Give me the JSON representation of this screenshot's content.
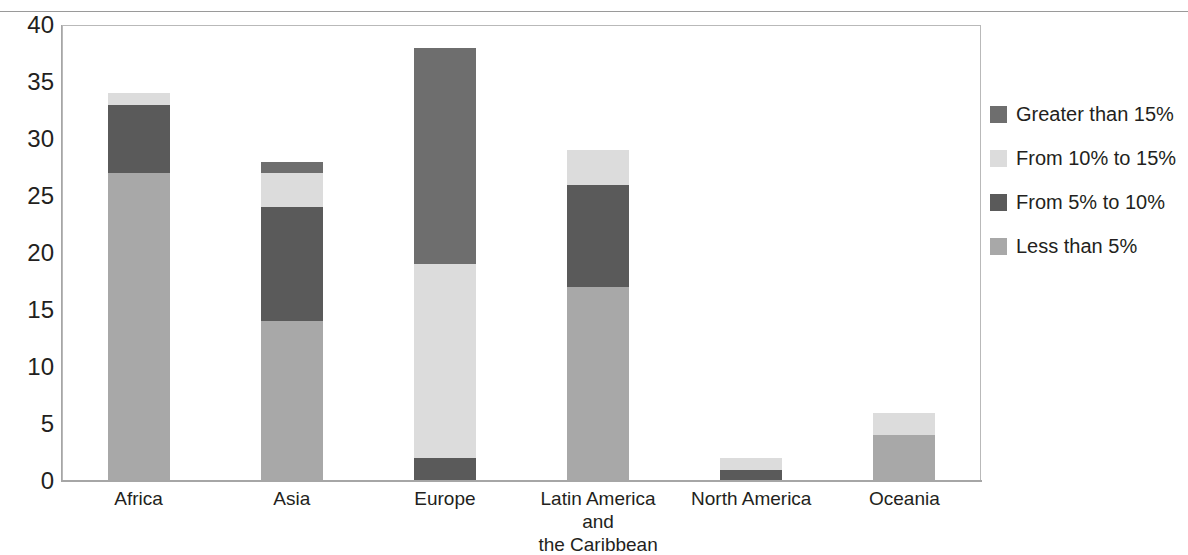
{
  "chart_data": {
    "type": "bar",
    "subtype": "stacked-vertical",
    "title": "",
    "xlabel": "",
    "ylabel": "",
    "ylim": [
      0,
      40
    ],
    "ytick_step": 5,
    "yticks": [
      40,
      35,
      30,
      25,
      20,
      15,
      10,
      5,
      0
    ],
    "grid": false,
    "legend_position": "right",
    "categories": [
      "Africa",
      "Asia",
      "Europe",
      "Latin America and the Caribbean",
      "North America",
      "Oceania"
    ],
    "series": [
      {
        "name": "Greater than 15%",
        "color": "#6e6e6e",
        "values": [
          0,
          1,
          19,
          0,
          0,
          0
        ]
      },
      {
        "name": "From 10% to 15%",
        "color": "#dcdcdc",
        "values": [
          1,
          3,
          17,
          3,
          1,
          2
        ]
      },
      {
        "name": "From 5% to 10%",
        "color": "#5a5a5a",
        "values": [
          6,
          10,
          2,
          9,
          1,
          0
        ]
      },
      {
        "name": "Less than 5%",
        "color": "#a8a8a8",
        "values": [
          27,
          14,
          0,
          17,
          0,
          4
        ]
      }
    ],
    "totals": [
      34,
      28,
      38,
      29,
      2,
      6
    ]
  },
  "axis": {
    "y_labels": [
      "40",
      "35",
      "30",
      "25",
      "20",
      "15",
      "10",
      "5",
      "0"
    ],
    "x_labels": [
      "Africa",
      "Asia",
      "Europe",
      "Latin America and\nthe Caribbean",
      "North America",
      "Oceania"
    ]
  },
  "legend": {
    "items": [
      {
        "label": "Greater than 15%",
        "color": "#6e6e6e"
      },
      {
        "label": "From 10% to 15%",
        "color": "#dcdcdc"
      },
      {
        "label": "From 5% to 10%",
        "color": "#5a5a5a"
      },
      {
        "label": "Less than 5%",
        "color": "#a8a8a8"
      }
    ]
  }
}
